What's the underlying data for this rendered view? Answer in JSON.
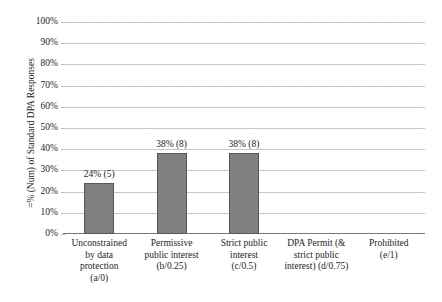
{
  "cutoff_caption": "",
  "chart_data": {
    "type": "bar",
    "title": "",
    "xlabel": "",
    "ylabel": "=% (Num) of Standard DPA Responses",
    "ylim": [
      0,
      100
    ],
    "grid": true,
    "legend": "none",
    "y_ticks": [
      "0%",
      "10%",
      "20%",
      "30%",
      "40%",
      "50%",
      "60%",
      "70%",
      "80%",
      "90%",
      "100%"
    ],
    "y_tick_values": [
      0,
      10,
      20,
      30,
      40,
      50,
      60,
      70,
      80,
      90,
      100
    ],
    "categories": [
      "Unconstrained by data protection (a/0)",
      "Permissive public interest (b/0.25)",
      "Strict public interest (c/0.5)",
      "DPA Permit (& strict public interest) (d/0.75)",
      "Prohibited (e/1)"
    ],
    "category_lines": [
      [
        "Unconstrained",
        "by data",
        "protection",
        "(a/0)"
      ],
      [
        "Permissive",
        "public interest",
        "(b/0.25)"
      ],
      [
        "Strict public",
        "interest",
        "(c/0.5)"
      ],
      [
        "DPA Permit (&",
        "strict public",
        "interest) (d/0.75)"
      ],
      [
        "Prohibited",
        "(e/1)"
      ]
    ],
    "values": [
      24,
      38,
      38,
      0,
      0
    ],
    "counts": [
      5,
      8,
      8,
      0,
      0
    ],
    "data_labels": [
      "24% (5)",
      "38% (8)",
      "38% (8)",
      "",
      ""
    ],
    "bar_color": "#808080",
    "bar_border_color": "#575757",
    "gridline_color": "#c8c6c4",
    "axis_color": "#7a7775",
    "text_color": "#231f20"
  }
}
